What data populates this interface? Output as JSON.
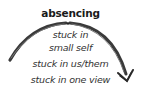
{
  "diagram": {
    "title": "absencing",
    "items": [
      {
        "lines": [
          "stuck in",
          "small self"
        ]
      },
      {
        "lines": [
          "stuck in us/them"
        ]
      },
      {
        "lines": [
          "stuck in one view"
        ]
      }
    ],
    "arrow": {
      "shape": "arc",
      "direction": "left-to-right, clockwise",
      "color": "#3a3a3a"
    }
  }
}
